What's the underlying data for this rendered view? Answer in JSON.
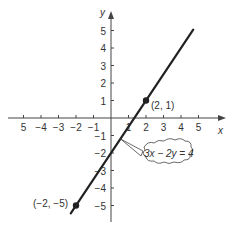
{
  "chart_data": {
    "type": "line",
    "title": "",
    "xlabel": "x",
    "ylabel": "y",
    "xlim": [
      -5.5,
      5.5
    ],
    "ylim": [
      -5.5,
      5.5
    ],
    "x_ticks": [
      -5,
      -4,
      -3,
      -2,
      -1,
      1,
      2,
      3,
      4,
      5
    ],
    "y_ticks": [
      -5,
      -4,
      -3,
      -2,
      -1,
      1,
      2,
      3,
      4,
      5
    ],
    "x_tick_labels": [
      "5",
      "−4",
      "−3",
      "−2",
      "−1",
      "1",
      "2",
      "3",
      "4",
      "5"
    ],
    "y_tick_labels": [
      "−5",
      "−4",
      "−3",
      "−2",
      "−1",
      "1",
      "2",
      "3",
      "4",
      "5"
    ],
    "grid": false,
    "series": [
      {
        "name": "3x − 2y = 4",
        "equation": "3x − 2y = 4",
        "x": [
          -2.3,
          4.7
        ],
        "y": [
          -5.45,
          5.05
        ],
        "color": "#222222"
      }
    ],
    "points": [
      {
        "x": 2,
        "y": 1,
        "label": "(2, 1)"
      },
      {
        "x": -2,
        "y": -5,
        "label": "(−2, −5)"
      }
    ],
    "annotations": [
      {
        "text": "3x − 2y = 4",
        "style": "cloud-callout",
        "points_to": [
          0.55,
          -1.2
        ]
      }
    ]
  },
  "labels": {
    "x_axis": "x",
    "y_axis": "y",
    "point_a": "(2, 1)",
    "point_b": "(−2, −5)",
    "equation": "3x − 2y = 4"
  },
  "colors": {
    "axis": "#444444",
    "line": "#222222",
    "text": "#333333"
  }
}
